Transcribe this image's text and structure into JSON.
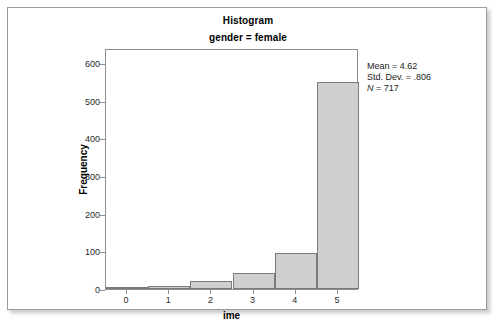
{
  "top_sliver": {
    "text": ""
  },
  "figure": {
    "title": "Histogram",
    "subtitle": "gender = female"
  },
  "chart_data": {
    "type": "bar",
    "title": "Histogram",
    "subtitle": "gender = female",
    "xlabel": "ime",
    "ylabel": "Frequency",
    "categories": [
      "0",
      "1",
      "2",
      "3",
      "4",
      "5"
    ],
    "values": [
      2,
      7,
      20,
      43,
      96,
      549
    ],
    "x": [
      0,
      1,
      2,
      3,
      4,
      5
    ],
    "xlim": [
      -0.5,
      5.5
    ],
    "ylim": [
      0,
      640
    ],
    "x_ticks": [
      "0",
      "1",
      "2",
      "3",
      "4",
      "5"
    ],
    "y_ticks": [
      "0",
      "100",
      "200",
      "300",
      "400",
      "500",
      "600"
    ],
    "y_tick_values": [
      0,
      100,
      200,
      300,
      400,
      500,
      600
    ],
    "grid": false,
    "legend": "none",
    "bar_fill_color": "#cfcfcf",
    "bar_border_color": "#7a7a7a",
    "plot_background": "#ffffff"
  },
  "statistics": {
    "mean_label": "Mean = 4.62",
    "std_dev_label": "Std. Dev. = .806",
    "n_label": "N",
    "n_value": " = 717"
  }
}
